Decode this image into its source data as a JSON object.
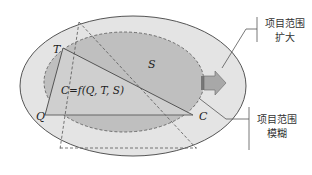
{
  "diagram": {
    "vertices": {
      "T": "T",
      "Q": "Q",
      "C": "C"
    },
    "region_label": "S",
    "formula": "C=f(Q, T, S)",
    "callouts": {
      "expand": {
        "line1": "项目范围",
        "line2": "扩大"
      },
      "fuzzy": {
        "line1": "项目范围",
        "line2": "模糊"
      }
    },
    "colors": {
      "outer_fill": "#e3e3e3",
      "inner_fill": "#bdbdbd",
      "outline": "#555555",
      "arrow_fill": "#a8a8a8"
    }
  }
}
